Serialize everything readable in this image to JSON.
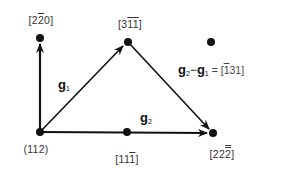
{
  "diagram": {
    "points": [
      {
        "id": "origin",
        "x": 40,
        "y": 132,
        "label": "(112)"
      },
      {
        "id": "p220",
        "x": 40,
        "y": 38,
        "label_parts": [
          "[2",
          "2",
          "0]"
        ]
      },
      {
        "id": "p311",
        "x": 128,
        "y": 42,
        "label_parts": [
          "[3",
          "1",
          "1",
          "]"
        ]
      },
      {
        "id": "p111",
        "x": 127,
        "y": 132,
        "label_parts": [
          "[11",
          "1",
          "]"
        ]
      },
      {
        "id": "p222",
        "x": 213,
        "y": 133,
        "label_parts": [
          "[22",
          "2",
          "]"
        ]
      },
      {
        "id": "lone",
        "x": 211,
        "y": 42
      }
    ],
    "labels": {
      "origin": "(112)",
      "p220_a": "[2",
      "p220_bar": "2",
      "p220_b": "0]",
      "p311_a": "[3",
      "p311_bar1": "1",
      "p311_bar2": "1",
      "p311_b": "]",
      "p111_a": "[11",
      "p111_bar": "1",
      "p111_b": "]",
      "p222_a": "[22",
      "p222_bar": "2",
      "p222_b": "]"
    },
    "vectors": {
      "g1": {
        "base": "g",
        "sub": "1"
      },
      "g2": {
        "base": "g",
        "sub": "2"
      }
    },
    "equation": {
      "lhs_a": "g",
      "lhs_a_sub": "2",
      "minus": "−",
      "lhs_b": "g",
      "lhs_b_sub": "1",
      "eq": " = ",
      "rhs_open": "[",
      "rhs_bar": "1",
      "rhs_rest": "31]"
    },
    "colors": {
      "ink": "#111111",
      "label": "#333333",
      "background": "#ffffff"
    }
  }
}
